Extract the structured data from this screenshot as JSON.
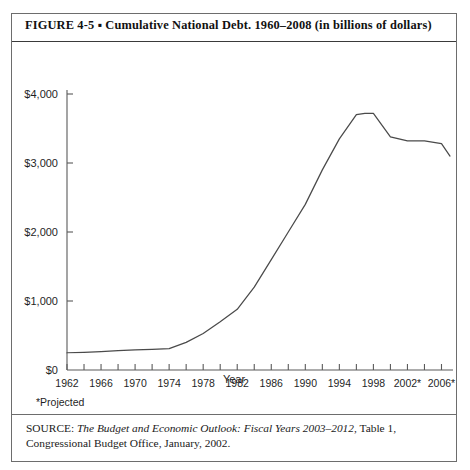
{
  "figure": {
    "label": "FIGURE  4-5",
    "separator": "▪",
    "title": "Cumulative National Debt. 1960–2008 (in billions of dollars)",
    "full_title": "FIGURE  4-5  ▪  Cumulative National Debt. 1960–2008 (in billions of dollars)",
    "projected_note": "*Projected",
    "source_label": "SOURCE:",
    "source_title": "The Budget and Economic Outlook: Fiscal Years 2003–2012",
    "source_rest": ", Table 1, Congressional Budget Office, January, 2002.",
    "source_full": "SOURCE: The Budget and Economic Outlook: Fiscal Years 2003–2012, Table 1, Congressional Budget Office, January, 2002."
  },
  "colors": {
    "line": "#4a4a4a",
    "axis": "#5a5a5a",
    "border": "#6d6d6d",
    "title_rule": "#3a3a3a",
    "text": "#1f1f1f",
    "background": "#ffffff"
  },
  "chart_data": {
    "type": "line",
    "title": "Cumulative National Debt. 1960–2008 (in billions of dollars)",
    "xlabel": "Year",
    "ylabel": "",
    "grid": false,
    "legend": "none",
    "xlim": [
      1962,
      2007
    ],
    "ylim": [
      0,
      4000
    ],
    "ytick_labels": [
      "$0",
      "$1,000",
      "$2,000",
      "$3,000",
      "$4,000"
    ],
    "ytick_values": [
      0,
      1000,
      2000,
      3000,
      4000
    ],
    "xtick_labels": [
      "1962",
      "1966",
      "1970",
      "1974",
      "1978",
      "1982",
      "1986",
      "1990",
      "1994",
      "1998",
      "2002*",
      "2006*"
    ],
    "xtick_values": [
      1962,
      1966,
      1970,
      1974,
      1978,
      1982,
      1986,
      1990,
      1994,
      1998,
      2002,
      2006
    ],
    "minor_xtick_values": [
      1964,
      1968,
      1972,
      1976,
      1980,
      1984,
      1988,
      1992,
      1996,
      2000,
      2004
    ],
    "series": [
      {
        "name": "Cumulative National Debt",
        "x": [
          1962,
          1964,
          1966,
          1968,
          1970,
          1972,
          1974,
          1976,
          1978,
          1980,
          1982,
          1984,
          1986,
          1988,
          1990,
          1992,
          1994,
          1996,
          1997,
          1998,
          2000,
          2002,
          2004,
          2006,
          2007
        ],
        "values": [
          250,
          255,
          265,
          280,
          290,
          300,
          310,
          400,
          530,
          700,
          880,
          1200,
          1600,
          2000,
          2400,
          2900,
          3350,
          3700,
          3720,
          3720,
          3380,
          3320,
          3320,
          3280,
          3100
        ]
      }
    ],
    "annotations": [
      "*Projected"
    ]
  }
}
